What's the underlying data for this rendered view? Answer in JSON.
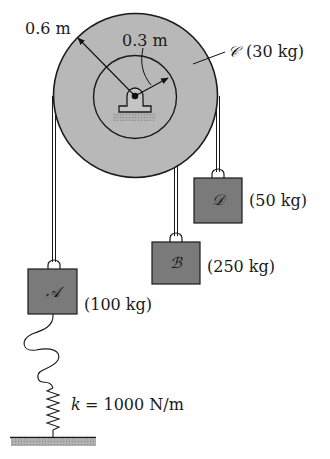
{
  "figure": {
    "pulley": {
      "name": "C",
      "symbol": "𝒞",
      "mass_label": "(30 kg)",
      "outer_radius_label": "0.6 m",
      "inner_radius_label": "0.3 m"
    },
    "blocks": [
      {
        "id": "A",
        "symbol": "𝒜",
        "mass_label": "(100 kg)"
      },
      {
        "id": "B",
        "symbol": "ℬ",
        "mass_label": "(250 kg)"
      },
      {
        "id": "D",
        "symbol": "𝒟",
        "mass_label": "(50 kg)"
      }
    ],
    "spring": {
      "label_k": "k",
      "label_rest": "= 1000 N/m"
    },
    "colors": {
      "pulley_fill": "#b8b8b8",
      "block_fill": "#7a7a7a",
      "stroke": "#1a1a1a",
      "hatch": "#a8a8a8"
    }
  }
}
